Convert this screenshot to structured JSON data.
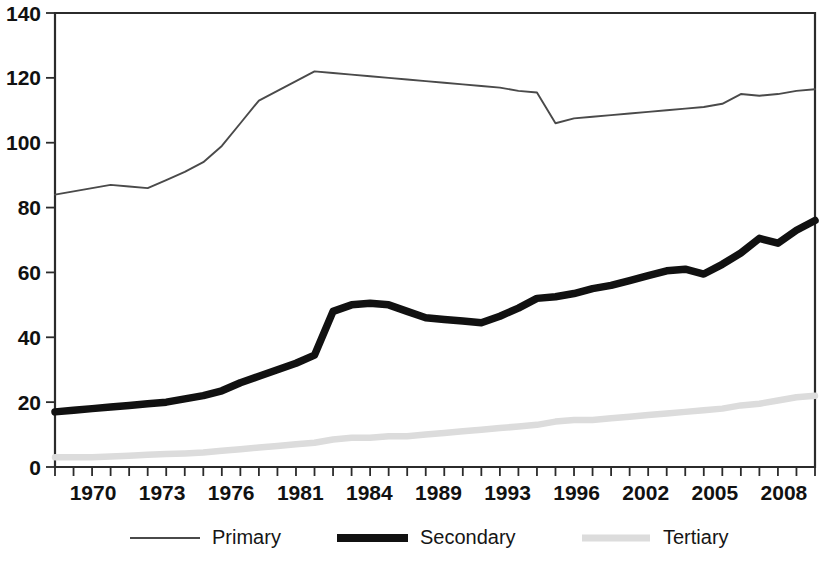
{
  "chart_data": {
    "type": "line",
    "title": "",
    "subtitle": "",
    "xlabel": "",
    "ylabel": "",
    "xlim": [
      1970,
      2011
    ],
    "ylim": [
      0,
      140
    ],
    "yticks": [
      0,
      20,
      40,
      60,
      80,
      100,
      120,
      140
    ],
    "ytick_labels": [
      "0",
      "20",
      "40",
      "60",
      "80",
      "100",
      "120",
      "140"
    ],
    "xtick_labels": [
      "1970",
      "1973",
      "1976",
      "1981",
      "1984",
      "1989",
      "1993",
      "1996",
      "2002",
      "2005",
      "2008"
    ],
    "xtick_years": [
      1970,
      1973,
      1976,
      1981,
      1984,
      1989,
      1993,
      1996,
      2002,
      2005,
      2008
    ],
    "grid": false,
    "legend_position": "bottom",
    "x": [
      1970,
      1971,
      1972,
      1973,
      1974,
      1975,
      1976,
      1977,
      1978,
      1979,
      1980,
      1981,
      1982,
      1983,
      1984,
      1985,
      1986,
      1987,
      1988,
      1989,
      1990,
      1991,
      1992,
      1993,
      1994,
      1995,
      1996,
      1997,
      1998,
      1999,
      2000,
      2001,
      2002,
      2003,
      2004,
      2005,
      2006,
      2007,
      2008,
      2009,
      2010,
      2011
    ],
    "series": [
      {
        "name": "Primary",
        "style": "thin-line",
        "color": "#4a4a4a",
        "values": [
          84,
          85,
          86,
          87,
          86.5,
          86,
          88.5,
          91,
          94,
          99,
          106,
          113,
          116,
          119,
          122,
          121.5,
          121,
          120.5,
          120,
          119.5,
          119,
          118.5,
          118,
          117.5,
          117,
          116,
          115.5,
          106,
          107.5,
          108,
          108.5,
          109,
          109.5,
          110,
          110.5,
          111,
          112,
          115,
          114.5,
          115,
          116,
          116.5
        ]
      },
      {
        "name": "Secondary",
        "style": "thick-line",
        "color": "#111111",
        "values": [
          17,
          17.5,
          18,
          18.5,
          19,
          19.5,
          20,
          21,
          22,
          23.5,
          26,
          28,
          30,
          32,
          34.5,
          48,
          50,
          50.5,
          50,
          48,
          46,
          45.5,
          45,
          44.5,
          46.5,
          49,
          52,
          52.5,
          53.5,
          55,
          56,
          57.5,
          59,
          60.5,
          61,
          59.5,
          62.5,
          66,
          70.5,
          69,
          73,
          76
        ]
      },
      {
        "name": "Tertiary",
        "style": "light-line",
        "color": "#dcdcdc",
        "values": [
          3,
          3,
          3,
          3.2,
          3.5,
          3.8,
          4,
          4.2,
          4.5,
          5,
          5.5,
          6,
          6.5,
          7,
          7.5,
          8.5,
          9,
          9,
          9.5,
          9.5,
          10,
          10.5,
          11,
          11.5,
          12,
          12.5,
          13,
          14,
          14.5,
          14.5,
          15,
          15.5,
          16,
          16.5,
          17,
          17.5,
          18,
          19,
          19.5,
          20.5,
          21.5,
          22
        ]
      }
    ]
  },
  "legend": {
    "items": [
      {
        "label": "Primary",
        "series": "Primary"
      },
      {
        "label": "Secondary",
        "series": "Secondary"
      },
      {
        "label": "Tertiary",
        "series": "Tertiary"
      }
    ]
  }
}
